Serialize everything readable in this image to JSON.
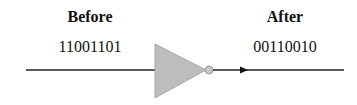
{
  "diagram": {
    "before": {
      "title": "Before",
      "value": "11001101"
    },
    "after": {
      "title": "After",
      "value": "00110010"
    },
    "gate": {
      "type": "NOT",
      "icon": "inverter-gate-icon",
      "fill": "#bdbdbd"
    },
    "line_color": "#222222"
  }
}
